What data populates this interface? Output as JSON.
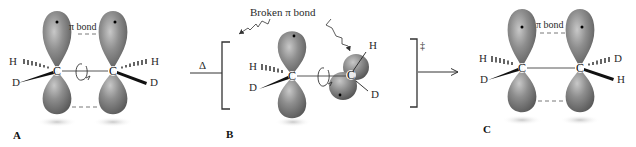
{
  "figure": {
    "panels": [
      {
        "id": "A",
        "label": "A",
        "pi_bond_label": "π bond",
        "left_carbon": {
          "atom": "C",
          "wedge_hash": "H",
          "wedge_solid": "D"
        },
        "right_carbon": {
          "atom": "C",
          "wedge_hash": "H",
          "wedge_solid": "D"
        }
      },
      {
        "id": "B",
        "label": "B",
        "broken_bond_label": "Broken π bond",
        "left_carbon": {
          "atom": "C",
          "wedge_hash": "H",
          "wedge_solid": "D"
        },
        "right_carbon": {
          "atom": "C",
          "sub_top": "H",
          "sub_bottom": "D"
        },
        "transition_state_symbol": "‡"
      },
      {
        "id": "C",
        "label": "C",
        "pi_bond_label": "π bond",
        "left_carbon": {
          "atom": "C",
          "wedge_hash": "H",
          "wedge_solid": "D"
        },
        "right_carbon": {
          "atom": "C",
          "wedge_hash": "D",
          "wedge_solid": "H"
        }
      }
    ],
    "heat_symbol": "Δ",
    "colors": {
      "orbital": "#8a8a8a",
      "orbital_highlight": "#c4c4c4",
      "orbital_shadow": "#5e5e5e",
      "line": "#3a3a3a",
      "text": "#2a2a2a"
    }
  }
}
